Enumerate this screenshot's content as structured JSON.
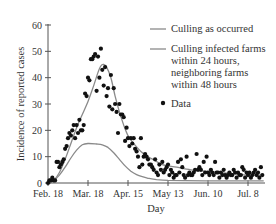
{
  "chart_data": {
    "type": "line",
    "title": "",
    "xlabel": "Day",
    "ylabel": "Incidence of reported cases",
    "ylim": [
      0,
      60
    ],
    "xlim_days": [
      0,
      151
    ],
    "y_ticks": [
      0,
      10,
      20,
      30,
      40,
      50,
      60
    ],
    "x_ticks": [
      {
        "label": "Feb. 18",
        "day": 0
      },
      {
        "label": "Mar. 18",
        "day": 28
      },
      {
        "label": "Apr. 15",
        "day": 56
      },
      {
        "label": "May 13",
        "day": 84
      },
      {
        "label": "Jun. 10",
        "day": 112
      },
      {
        "label": "Jul. 8",
        "day": 140
      }
    ],
    "grid": false,
    "legend_position": "upper right",
    "legend": [
      {
        "label": "Culling as occurred",
        "kind": "line"
      },
      {
        "label": "Culling infected farms within 24 hours, neighboring farms within 48 hours",
        "kind": "line"
      },
      {
        "label": "Data",
        "kind": "marker"
      }
    ],
    "series": [
      {
        "name": "Culling as occurred",
        "kind": "line",
        "color": "#8a8a8a",
        "x": [
          0,
          4,
          8,
          12,
          16,
          20,
          24,
          28,
          32,
          35,
          37,
          39,
          41,
          44,
          47,
          50,
          53,
          56,
          60,
          65,
          70,
          75,
          80,
          90,
          100,
          110,
          120,
          130,
          140,
          151
        ],
        "y": [
          0,
          1,
          4,
          9,
          15,
          21,
          26,
          31,
          37,
          42,
          44.5,
          45,
          44,
          40,
          33,
          27,
          22,
          18,
          15,
          12,
          10,
          8.5,
          7,
          6,
          5,
          4.5,
          4,
          3.5,
          3,
          3
        ]
      },
      {
        "name": "Culling infected farms within 24 hours, neighboring farms within 48 hours",
        "kind": "line",
        "color": "#8a8a8a",
        "x": [
          0,
          4,
          8,
          12,
          16,
          20,
          24,
          28,
          34,
          38,
          42,
          46,
          50,
          54,
          58,
          62,
          66,
          70,
          76,
          84,
          96,
          110,
          125,
          140,
          151
        ],
        "y": [
          0,
          1,
          3,
          6,
          9.5,
          12.5,
          14.5,
          15,
          14.8,
          14.5,
          13.5,
          11.5,
          9,
          6.5,
          4.5,
          3.2,
          2.4,
          1.8,
          1.3,
          1.0,
          0.9,
          0.8,
          0.8,
          0.8,
          0.8
        ]
      },
      {
        "name": "Data",
        "kind": "scatter",
        "color": "#111111",
        "x": [
          0,
          1,
          2,
          3,
          4,
          5,
          6,
          7,
          8,
          9,
          10,
          11,
          12,
          13,
          14,
          15,
          16,
          17,
          18,
          19,
          20,
          21,
          22,
          23,
          24,
          25,
          26,
          27,
          28,
          29,
          30,
          31,
          32,
          33,
          34,
          35,
          36,
          37,
          38,
          39,
          40,
          41,
          42,
          43,
          44,
          45,
          46,
          47,
          48,
          49,
          50,
          51,
          52,
          53,
          54,
          55,
          56,
          57,
          58,
          59,
          60,
          61,
          62,
          63,
          64,
          65,
          66,
          67,
          68,
          69,
          70,
          71,
          72,
          73,
          74,
          75,
          76,
          77,
          78,
          79,
          80,
          81,
          82,
          83,
          84,
          85,
          86,
          87,
          88,
          89,
          90,
          91,
          92,
          93,
          94,
          95,
          96,
          97,
          98,
          99,
          100,
          101,
          102,
          103,
          104,
          105,
          106,
          107,
          108,
          109,
          110,
          111,
          112,
          113,
          114,
          115,
          116,
          117,
          118,
          119,
          120,
          121,
          122,
          123,
          124,
          125,
          126,
          127,
          128,
          129,
          130,
          131,
          132,
          133,
          134,
          135,
          136,
          137,
          138,
          139,
          140,
          141,
          142,
          143,
          144,
          145,
          146,
          147,
          148,
          149,
          150
        ],
        "y": [
          0,
          1,
          1,
          2,
          1,
          1,
          8,
          8,
          6,
          7,
          8,
          9,
          13,
          14,
          17,
          19,
          18,
          20,
          22,
          17,
          22,
          19,
          24,
          20,
          20,
          22,
          34,
          33,
          40,
          39,
          47,
          47,
          48,
          49,
          35,
          48,
          40,
          51,
          43,
          37,
          44,
          33,
          36,
          29,
          41,
          28,
          36,
          30,
          27,
          19,
          30,
          26,
          26,
          25,
          16,
          21,
          17,
          14,
          17,
          15,
          17,
          13,
          12,
          10,
          6,
          17,
          7,
          10,
          11,
          10,
          9,
          7,
          7,
          6,
          5,
          9,
          4,
          3,
          7,
          5,
          8,
          4,
          5,
          6,
          7,
          3,
          5,
          4,
          2,
          3,
          3,
          8,
          4,
          9,
          6,
          3,
          2,
          10,
          3,
          4,
          3,
          3,
          4,
          5,
          11,
          5,
          6,
          5,
          3,
          8,
          4,
          10,
          4,
          3,
          5,
          4,
          3,
          8,
          4,
          4,
          2,
          4,
          3,
          5,
          3,
          2,
          3,
          4,
          3,
          3,
          5,
          4,
          2,
          4,
          3,
          3,
          6,
          5,
          2,
          4,
          3,
          4,
          2,
          3,
          4,
          5,
          3,
          4,
          2,
          6,
          3
        ]
      }
    ]
  },
  "axes": {
    "ylabel": "Incidence of reported cases",
    "xlabel": "Day",
    "y_tick_labels": [
      "0",
      "10",
      "20",
      "30",
      "40",
      "50",
      "60"
    ],
    "x_tick_labels": [
      "Feb. 18",
      "Mar. 18",
      "Apr. 15",
      "May 13",
      "Jun. 10",
      "Jul. 8"
    ]
  },
  "legend": {
    "item1": "Culling as occurred",
    "item2_line1": "Culling infected farms",
    "item2_line2": "within 24 hours,",
    "item2_line3": "neighboring farms",
    "item2_line4": "within 48 hours",
    "item3": "Data"
  },
  "colors": {
    "curve": "#8a8a8a",
    "points": "#111111",
    "axis": "#555555",
    "text": "#333333"
  }
}
